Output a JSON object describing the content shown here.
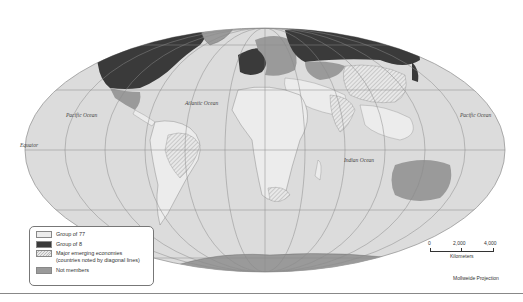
{
  "map": {
    "projection_label": "Mollweide Projection",
    "ocean_labels": [
      {
        "id": "pacific-west",
        "text": "Pacific Ocean"
      },
      {
        "id": "atlantic",
        "text": "Atlantic Ocean"
      },
      {
        "id": "indian",
        "text": "Indian Ocean"
      },
      {
        "id": "pacific-east",
        "text": "Pacific Ocean"
      }
    ],
    "equator_label": "Equator",
    "colors": {
      "ocean": "#dcdcdc",
      "group_of_77": "#ececec",
      "group_of_8": "#3a3a3a",
      "not_members": "#9a9a9a",
      "graticule": "#8a8a8a"
    }
  },
  "legend": {
    "items": [
      {
        "label": "Group of 77",
        "swatch": "g77"
      },
      {
        "label": "Group of 8",
        "swatch": "g8"
      },
      {
        "label": "Major emerging economies (countries noted by diagonal lines)",
        "swatch": "emerging"
      },
      {
        "label": "Not members",
        "swatch": "nonmember"
      }
    ]
  },
  "scale": {
    "ticks": [
      "0",
      "2,000",
      "4,000"
    ],
    "unit": "Kilometers"
  }
}
